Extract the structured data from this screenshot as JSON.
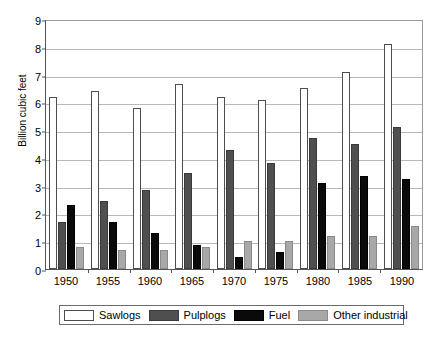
{
  "chart_data": {
    "type": "bar",
    "title": "",
    "subtitle": "",
    "xlabel": "",
    "ylabel": "Billion cubic feet",
    "ylim": [
      0,
      9
    ],
    "ytick_labels": [
      "9",
      "8",
      "7",
      "6",
      "5",
      "4",
      "3",
      "2",
      "1",
      "0"
    ],
    "ytick_values": [
      9,
      8,
      7,
      6,
      5,
      4,
      3,
      2,
      1,
      0
    ],
    "grid": true,
    "legend_position": "bottom",
    "categories": [
      "1950",
      "1955",
      "1960",
      "1965",
      "1970",
      "1975",
      "1980",
      "1985",
      "1990"
    ],
    "series": [
      {
        "name": "Sawlogs",
        "color": "#ffffff",
        "values": [
          6.2,
          6.4,
          5.8,
          6.65,
          6.2,
          6.1,
          6.5,
          7.1,
          8.1
        ]
      },
      {
        "name": "Pulplogs",
        "color": "#4f4f4f",
        "values": [
          1.7,
          2.45,
          2.85,
          3.45,
          4.3,
          3.8,
          4.7,
          4.5,
          5.1
        ]
      },
      {
        "name": "Fuel",
        "color": "#0a0a0a",
        "values": [
          2.3,
          1.7,
          1.3,
          0.85,
          0.45,
          0.6,
          3.1,
          3.35,
          3.25
        ]
      },
      {
        "name": "Other industrial",
        "color": "#a8a8a8",
        "values": [
          0.8,
          0.7,
          0.7,
          0.8,
          1.0,
          1.0,
          1.2,
          1.2,
          1.55
        ]
      }
    ]
  },
  "legend": {
    "items": [
      {
        "label": "Sawlogs",
        "key": "sawlogs"
      },
      {
        "label": "Pulplogs",
        "key": "pulplogs"
      },
      {
        "label": "Fuel",
        "key": "fuel"
      },
      {
        "label": "Other industrial",
        "key": "other"
      }
    ]
  },
  "colors": {
    "sawlogs": "#ffffff",
    "pulplogs": "#4f4f4f",
    "fuel": "#0a0a0a",
    "other_industrial": "#a8a8a8",
    "gridline": "#b8b8b8",
    "axis": "#555555"
  }
}
